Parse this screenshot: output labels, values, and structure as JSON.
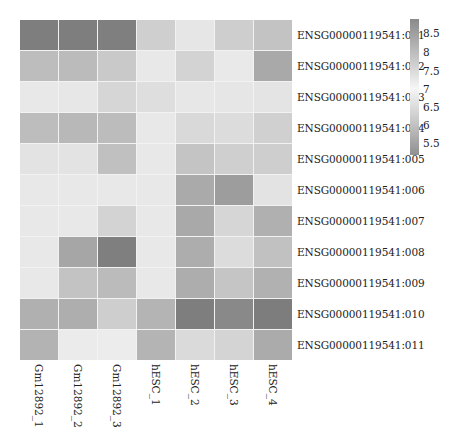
{
  "chart_data": {
    "type": "heatmap",
    "title": "",
    "xlabel": "",
    "ylabel": "",
    "columns": [
      "Gm12892_1",
      "Gm12892_2",
      "Gm12892_3",
      "hESC_1",
      "hESC_2",
      "hESC_3",
      "hESC_4"
    ],
    "rows": [
      "ENSG00000119541:001",
      "ENSG00000119541:002",
      "ENSG00000119541:003",
      "ENSG00000119541:004",
      "ENSG00000119541:005",
      "ENSG00000119541:006",
      "ENSG00000119541:007",
      "ENSG00000119541:008",
      "ENSG00000119541:009",
      "ENSG00000119541:010",
      "ENSG00000119541:011"
    ],
    "values": [
      [
        8.6,
        8.6,
        8.6,
        7.7,
        7.2,
        7.7,
        7.8
      ],
      [
        7.9,
        7.9,
        7.7,
        7.1,
        7.6,
        7.1,
        8.2
      ],
      [
        7.1,
        7.1,
        7.4,
        7.3,
        7.1,
        7.1,
        7.1
      ],
      [
        7.9,
        8.0,
        7.9,
        7.1,
        7.4,
        7.3,
        7.5
      ],
      [
        7.2,
        7.2,
        7.8,
        7.1,
        7.8,
        7.6,
        7.6
      ],
      [
        7.1,
        7.1,
        7.1,
        7.1,
        8.2,
        8.4,
        7.2
      ],
      [
        7.1,
        7.1,
        7.5,
        7.1,
        8.2,
        7.5,
        8.0
      ],
      [
        7.1,
        8.2,
        8.6,
        7.1,
        8.1,
        7.4,
        7.8
      ],
      [
        7.1,
        7.8,
        7.9,
        7.1,
        8.1,
        7.8,
        8.1
      ],
      [
        8.0,
        8.1,
        7.6,
        8.0,
        8.7,
        8.5,
        8.7
      ],
      [
        8.0,
        7.1,
        7.1,
        7.9,
        7.5,
        7.6,
        8.1
      ]
    ],
    "colors": [
      [
        "#7e7e7e",
        "#7e7e7e",
        "#7f7f7f",
        "#cfcfcf",
        "#e6e6e6",
        "#cecece",
        "#c3c3c3"
      ],
      [
        "#bdbdbd",
        "#bbbbbb",
        "#c9c9c9",
        "#e8e8e8",
        "#d3d3d3",
        "#e9e9e9",
        "#a9a9a9"
      ],
      [
        "#e8e8e8",
        "#e7e7e7",
        "#d6d6d6",
        "#dedede",
        "#e7e7e7",
        "#e6e6e6",
        "#e4e4e4"
      ],
      [
        "#bdbdbd",
        "#b8b8b8",
        "#bcbcbc",
        "#e8e8e8",
        "#d9d9d9",
        "#dcdcdc",
        "#d0d0d0"
      ],
      [
        "#e3e3e3",
        "#e3e3e3",
        "#c0c0c0",
        "#e8e8e8",
        "#c4c4c4",
        "#cfcfcf",
        "#cecece"
      ],
      [
        "#e8e8e8",
        "#e8e8e8",
        "#e8e8e8",
        "#e8e8e8",
        "#aaaaaa",
        "#9d9d9d",
        "#e3e3e3"
      ],
      [
        "#e8e8e8",
        "#e8e8e8",
        "#d3d3d3",
        "#e8e8e8",
        "#a9a9a9",
        "#d6d6d6",
        "#b0b0b0"
      ],
      [
        "#e8e8e8",
        "#a6a6a6",
        "#7f7f7f",
        "#e8e8e8",
        "#adadad",
        "#dcdcdc",
        "#c1c1c1"
      ],
      [
        "#e8e8e8",
        "#c3c3c3",
        "#bbbbbb",
        "#e8e8e8",
        "#adadad",
        "#c5c5c5",
        "#b1b1b1"
      ],
      [
        "#b0b0b0",
        "#aeaeae",
        "#cecece",
        "#b4b4b4",
        "#7e7e7e",
        "#898989",
        "#7d7d7d"
      ],
      [
        "#b3b3b3",
        "#ebebeb",
        "#ececec",
        "#b4b4b4",
        "#dadada",
        "#d4d4d4",
        "#ababab"
      ]
    ],
    "colorbar": {
      "ticks": [
        "8.5",
        "8",
        "7.5",
        "7",
        "6.5",
        "6",
        "5.5"
      ],
      "tick_positions_pct": [
        10.3,
        24.3,
        38.2,
        51.5,
        64.7,
        77.9,
        91.2
      ],
      "range": [
        5.2,
        8.9
      ],
      "scheme": "diverging gray (dark at extremes, light at 7)"
    },
    "legend_position": "right"
  }
}
